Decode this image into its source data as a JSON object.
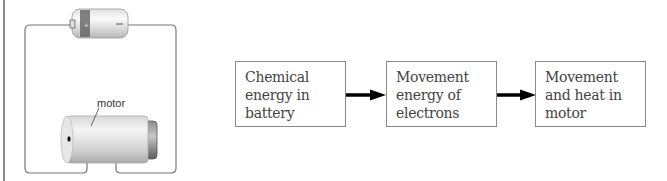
{
  "circuit": {
    "battery": {
      "positive_symbol": "+",
      "negative_symbol": "−"
    },
    "motor_label": "motor"
  },
  "flow": {
    "boxes": [
      {
        "lines": [
          "Chemical",
          "energy in",
          "battery"
        ]
      },
      {
        "lines": [
          "Movement",
          "energy of",
          "electrons"
        ]
      },
      {
        "lines": [
          "Movement",
          "and heat in",
          "motor"
        ]
      }
    ]
  },
  "colors": {
    "box_border": "#8a8a8a",
    "arrow": "#000000",
    "wire": "#777777",
    "text": "#444444"
  }
}
